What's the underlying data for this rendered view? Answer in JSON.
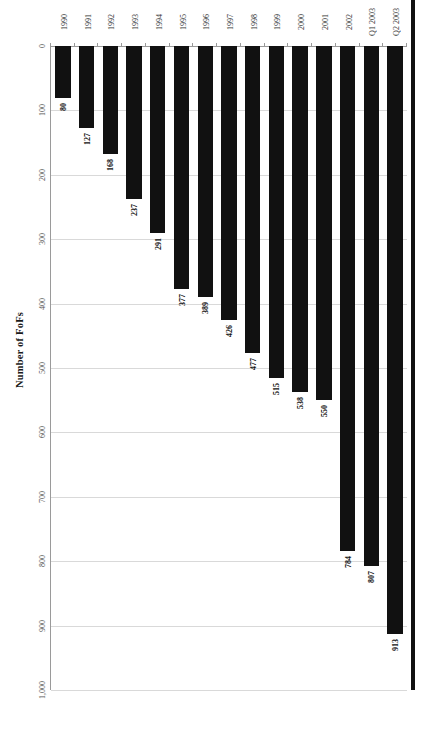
{
  "chart_data": {
    "type": "bar",
    "orientation": "horizontal",
    "title": "",
    "xlabel": "Number of FoFs",
    "ylabel": "",
    "categories": [
      "1990",
      "1991",
      "1992",
      "1993",
      "1994",
      "1995",
      "1996",
      "1997",
      "1998",
      "1999",
      "2000",
      "2001",
      "2002",
      "Q1 2003",
      "Q2 2003"
    ],
    "values": [
      80,
      127,
      168,
      237,
      291,
      377,
      389,
      426,
      477,
      515,
      538,
      550,
      784,
      807,
      913
    ],
    "value_labels": [
      "80",
      "127",
      "168",
      "237",
      "291",
      "377",
      "389",
      "426",
      "477",
      "515",
      "538",
      "550",
      "784",
      "807",
      "913"
    ],
    "axis_ticks": [
      0,
      100,
      200,
      300,
      400,
      500,
      600,
      700,
      800,
      900,
      1000
    ],
    "axis_tick_labels": [
      "0",
      "100",
      "200",
      "300",
      "400",
      "500",
      "600",
      "700",
      "800",
      "900",
      "1,000"
    ],
    "xlim": [
      0,
      1000
    ],
    "grid": true,
    "legend": false,
    "bar_color": "#111111",
    "grid_color": "#d9d9d9",
    "axis_color": "#9a9a9a"
  },
  "figure": {
    "axis_title": "Number of FoFs"
  }
}
